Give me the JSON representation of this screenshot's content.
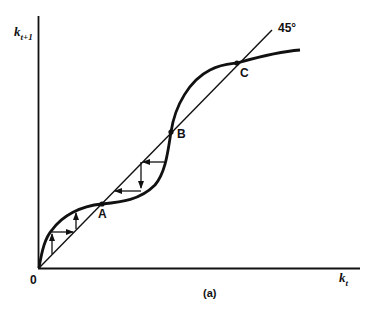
{
  "figure": {
    "y_axis_label": "k",
    "y_axis_sub": "t+1",
    "x_axis_label": "k",
    "x_axis_sub": "t",
    "origin_label": "0",
    "diagonal_label": "45°",
    "caption": "(a)",
    "points": [
      {
        "name": "A",
        "x": 102,
        "y": 204
      },
      {
        "name": "B",
        "x": 171,
        "y": 132
      },
      {
        "name": "C",
        "x": 237,
        "y": 63
      }
    ]
  },
  "colors": {
    "ink": "#111111",
    "background": "#ffffff"
  }
}
